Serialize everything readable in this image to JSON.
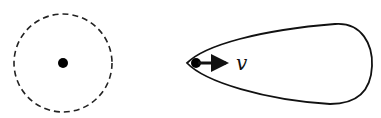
{
  "diagram": {
    "left_figure": {
      "shape": "dashed-circle",
      "center": [
        63,
        63
      ],
      "radius": 49,
      "dot_radius": 5
    },
    "right_figure": {
      "shape": "teardrop-outline",
      "particle_dot": [
        196,
        63
      ],
      "velocity_arrow": {
        "from": [
          198,
          63
        ],
        "to": [
          232,
          63
        ]
      },
      "velocity_label": "v"
    },
    "colors": {
      "stroke": "#111111",
      "background": "#ffffff"
    }
  }
}
